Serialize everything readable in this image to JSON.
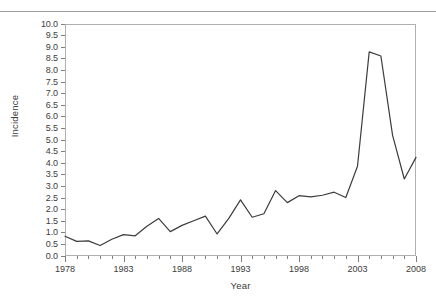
{
  "chart_data": {
    "type": "line",
    "title": "",
    "xlabel": "Year",
    "ylabel": "Incidence",
    "x": [
      1978,
      1979,
      1980,
      1981,
      1982,
      1983,
      1984,
      1985,
      1986,
      1987,
      1988,
      1989,
      1990,
      1991,
      1992,
      1993,
      1994,
      1995,
      1996,
      1997,
      1998,
      1999,
      2000,
      2001,
      2002,
      2003,
      2004,
      2005,
      2006,
      2007,
      2008
    ],
    "values": [
      0.85,
      0.63,
      0.65,
      0.45,
      0.72,
      0.92,
      0.87,
      1.28,
      1.62,
      1.05,
      1.32,
      1.52,
      1.72,
      0.95,
      1.62,
      2.42,
      1.67,
      1.82,
      2.82,
      2.3,
      2.6,
      2.55,
      2.62,
      2.75,
      2.52,
      3.87,
      8.8,
      8.62,
      5.2,
      3.32,
      4.25
    ],
    "series": [
      {
        "name": "Incidence",
        "color": "#3c3c3c",
        "values": [
          0.85,
          0.63,
          0.65,
          0.45,
          0.72,
          0.92,
          0.87,
          1.28,
          1.62,
          1.05,
          1.32,
          1.52,
          1.72,
          0.95,
          1.62,
          2.42,
          1.67,
          1.82,
          2.82,
          2.3,
          2.6,
          2.55,
          2.62,
          2.75,
          2.52,
          3.87,
          8.8,
          8.62,
          5.2,
          3.32,
          4.25
        ]
      }
    ],
    "xlim": [
      1978,
      2008
    ],
    "ylim": [
      0.0,
      10.0
    ],
    "ytick_step": 0.5,
    "yticks": [
      "10.0",
      "9.5",
      "9.0",
      "8.5",
      "8.0",
      "7.5",
      "7.0",
      "6.5",
      "6.0",
      "5.5",
      "5.0",
      "4.5",
      "4.0",
      "3.5",
      "3.0",
      "2.5",
      "2.0",
      "1.5",
      "1.0",
      "0.5",
      "0.0"
    ],
    "xticks_major": [
      "1978",
      "1983",
      "1988",
      "1993",
      "1998",
      "2003",
      "2008"
    ],
    "xtick_minor_step": 1,
    "grid": false,
    "legend": false,
    "legend_position": "none",
    "line_color": "#3c3c3c",
    "frame_color": "#b0b0b0",
    "background": "#ffffff"
  }
}
